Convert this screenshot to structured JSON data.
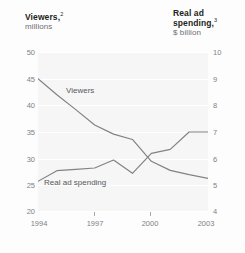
{
  "chart_data": {
    "type": "line",
    "title": "",
    "x": [
      1994,
      1995,
      1996,
      1997,
      1998,
      1999,
      2000,
      2001,
      2002,
      2003
    ],
    "xlabel": "",
    "xtick_labels": [
      "1994",
      "1997",
      "2000",
      "2003"
    ],
    "xtick_values": [
      1994,
      1997,
      2000,
      2003
    ],
    "grid": true,
    "legend": "inline-labels",
    "axes": [
      {
        "side": "left",
        "title_bold": "Viewers,",
        "title_sup": "2",
        "subtitle": "millions",
        "ylim": [
          20,
          50
        ],
        "ytick_labels": [
          "50",
          "45",
          "40",
          "35",
          "30",
          "25",
          "20"
        ],
        "ytick_values": [
          50,
          45,
          40,
          35,
          30,
          25,
          20
        ]
      },
      {
        "side": "right",
        "title_bold": "Real ad spending,",
        "title_bold_line1": "Real ad",
        "title_bold_line2": "spending,",
        "title_sup": "3",
        "subtitle": "$ billion",
        "ylim": [
          4,
          10
        ],
        "ytick_labels": [
          "10",
          "9",
          "8",
          "7",
          "6",
          "5",
          "4"
        ],
        "ytick_values": [
          10,
          9,
          8,
          7,
          6,
          5,
          4
        ]
      }
    ],
    "series": [
      {
        "name": "Viewers",
        "axis": "left",
        "unit": "millions",
        "color": "#808285",
        "values": [
          45.0,
          42.0,
          39.2,
          36.3,
          34.6,
          33.6,
          29.5,
          27.8,
          27.0,
          26.3
        ]
      },
      {
        "name": "Real ad spending",
        "axis": "right",
        "unit": "$ billion",
        "color": "#808285",
        "values": [
          5.15,
          5.55,
          5.6,
          5.65,
          5.95,
          5.45,
          6.2,
          6.35,
          7.0,
          7.0
        ]
      }
    ],
    "annotations": [
      {
        "text": "Viewers",
        "series": "Viewers"
      },
      {
        "text": "Real ad spending",
        "series": "Real ad spending"
      }
    ]
  },
  "colors": {
    "line": "#808285",
    "plot_background": "#f6f6f6",
    "gridline": "#ffffff",
    "tick_text": "#808285",
    "title_text": "#231f20",
    "subtitle_text": "#6d6e71"
  }
}
